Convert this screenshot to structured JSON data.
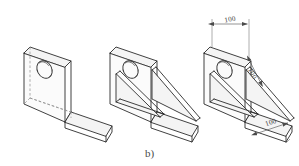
{
  "figure": {
    "caption": "b)",
    "background_color": "#ffffff",
    "line_color": "#2b2b2b",
    "hidden_line_color": "#8d8d8d",
    "dimension_color": "#4a4a4a",
    "views": [
      {
        "id": "view-1",
        "label": "plain-angle-bracket",
        "features": [
          "L-shaped plate",
          "circular hole in vertical face",
          "hidden lines shown dashed"
        ],
        "has_gussets": false,
        "has_hole": true,
        "has_hidden_lines": true,
        "dimensions": []
      },
      {
        "id": "view-2",
        "label": "angle-bracket-with-gussets",
        "features": [
          "L-shaped plate",
          "circular hole in vertical face",
          "two triangular gusset ribs"
        ],
        "has_gussets": true,
        "has_hole": true,
        "has_hidden_lines": false,
        "dimensions": []
      },
      {
        "id": "view-3",
        "label": "dimensioned-angle-bracket",
        "features": [
          "L-shaped plate",
          "circular hole in vertical face",
          "two triangular gusset ribs",
          "dimension annotations"
        ],
        "has_gussets": true,
        "has_hole": true,
        "has_hidden_lines": false,
        "dimensions": [
          {
            "id": "dim-width-top",
            "value": "100",
            "placement": "top",
            "orientation": "horizontal"
          },
          {
            "id": "dim-height-slope",
            "value": "100",
            "placement": "middle-right",
            "orientation": "diagonal"
          },
          {
            "id": "dim-depth-bottom",
            "value": "100",
            "placement": "bottom-right",
            "orientation": "diagonal"
          }
        ]
      }
    ]
  }
}
